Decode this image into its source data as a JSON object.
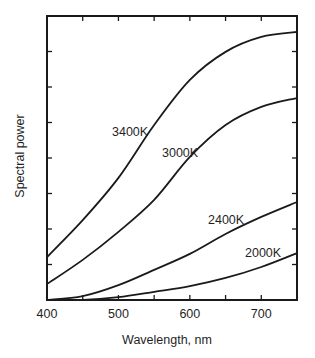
{
  "chart_data": {
    "type": "line",
    "title": "",
    "xlabel": "Wavelength, nm",
    "ylabel": "Spectral power",
    "xlim": [
      400,
      750
    ],
    "ylim": [
      0,
      8
    ],
    "x_ticks": [
      400,
      500,
      600,
      700
    ],
    "x_minor_ticks": [
      450,
      550,
      650
    ],
    "y_tick_count": 8,
    "grid": false,
    "legend": "inline labels",
    "x": [
      400,
      450,
      500,
      550,
      600,
      650,
      700,
      750
    ],
    "series": [
      {
        "name": "3400K",
        "values": [
          1.21,
          2.25,
          3.44,
          4.93,
          6.2,
          6.99,
          7.41,
          7.55
        ],
        "label_pos": [
          112,
          132
        ]
      },
      {
        "name": "3000K",
        "values": [
          0.45,
          1.13,
          1.92,
          2.82,
          4.03,
          4.93,
          5.44,
          5.69
        ],
        "label_pos": [
          162,
          153
        ]
      },
      {
        "name": "2400K",
        "values": [
          0.0,
          0.11,
          0.42,
          0.85,
          1.3,
          1.86,
          2.34,
          2.76
        ],
        "label_pos": [
          208,
          220
        ]
      },
      {
        "name": "2000K",
        "values": [
          0.0,
          0.0,
          0.08,
          0.23,
          0.39,
          0.62,
          0.93,
          1.32
        ],
        "label_pos": [
          245,
          253
        ]
      }
    ]
  },
  "colors": {
    "line": "#1a1a1a",
    "background": "#ffffff"
  }
}
